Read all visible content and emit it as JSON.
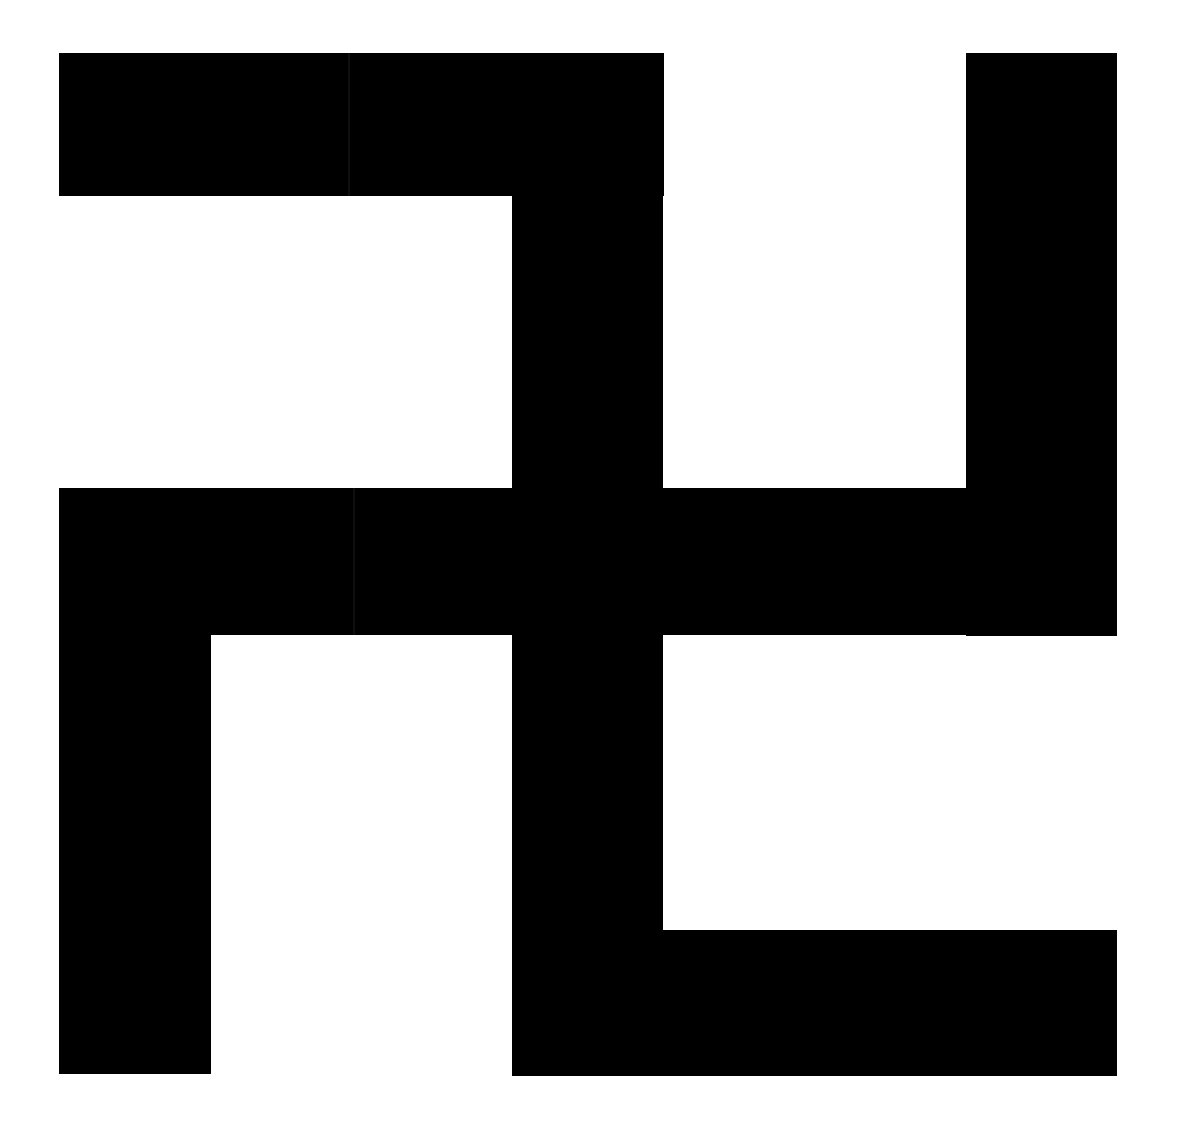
{
  "figure": {
    "name": "swastika-pinwheel-symbol",
    "symmetry": "4-fold rotational (90 degrees)",
    "canvas": {
      "width": 1178,
      "height": 1146
    },
    "colors": {
      "background": "#ffffff",
      "foreground": "#000000",
      "seam_artifact": "rgba(255,255,255,0.055)"
    },
    "stroke_thickness_px": 146,
    "bars": [
      {
        "id": "top-arm-horizontal",
        "label": "Top horizontal arm",
        "x": 59,
        "y": 53,
        "width": 605,
        "height": 143
      },
      {
        "id": "right-arm-vertical",
        "label": "Right vertical arm",
        "x": 966,
        "y": 53,
        "width": 151,
        "height": 583
      },
      {
        "id": "center-horizontal",
        "label": "Central horizontal bar",
        "x": 59,
        "y": 488,
        "width": 1058,
        "height": 147
      },
      {
        "id": "center-vertical",
        "label": "Central vertical bar",
        "x": 512,
        "y": 196,
        "width": 151,
        "height": 734
      },
      {
        "id": "left-arm-vertical",
        "label": "Left vertical arm",
        "x": 59,
        "y": 488,
        "width": 152,
        "height": 586
      },
      {
        "id": "bottom-arm-horizontal",
        "label": "Bottom horizontal arm",
        "x": 512,
        "y": 930,
        "width": 605,
        "height": 146
      }
    ],
    "seams": [
      {
        "id": "seam-top-bar",
        "x": 348,
        "y": 53,
        "width": 2,
        "height": 143
      },
      {
        "id": "seam-center-bar",
        "x": 353,
        "y": 488,
        "width": 2,
        "height": 147
      }
    ]
  }
}
